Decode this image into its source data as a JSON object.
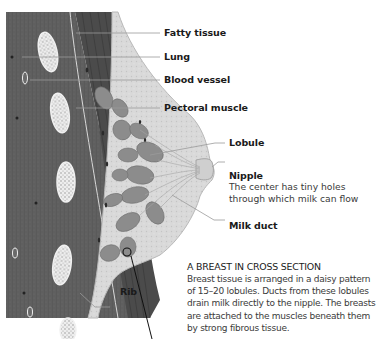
{
  "figure": {
    "type": "anatomical-illustration"
  },
  "labels": {
    "fatty_tissue": "Fatty tissue",
    "lung": "Lung",
    "blood_vessel": "Blood vessel",
    "pectoral_muscle": "Pectoral muscle",
    "lobule": "Lobule",
    "nipple": "Nipple",
    "nipple_desc_line1": "The center has tiny holes",
    "nipple_desc_line2": "through which milk can flow",
    "milk_duct": "Milk duct",
    "rib": "Rib"
  },
  "caption": {
    "title": "A BREAST IN CROSS SECTION",
    "lines": [
      "Breast tissue is arranged in a daisy pattern",
      "of 15–20 lobules. Ducts from these lobules",
      "drain milk directly to the nipple. The breasts",
      "are attached to the muscles beneath them",
      "by strong fibrous tissue."
    ]
  },
  "colors": {
    "chest_wall": "#5e5e5e",
    "muscle": "#4a4a4a",
    "fat": "#d6d6d6",
    "lobule": "#8a8a8a",
    "leader_line": "#9a9a9a",
    "text": "#1a1a1a"
  }
}
